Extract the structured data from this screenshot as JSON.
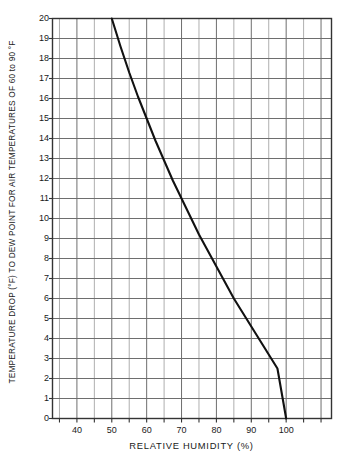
{
  "chart_data": {
    "type": "line",
    "title": "",
    "xlabel": "RELATIVE HUMIDITY (%)",
    "ylabel": "TEMPERATURE DROP (°F) TO DEW POINT FOR AIR TEMPERATURES OF 60 to 90 °F",
    "xlim": [
      33,
      113
    ],
    "ylim": [
      0,
      20
    ],
    "xticks": [
      40,
      50,
      60,
      70,
      80,
      90,
      100
    ],
    "yticks": [
      0,
      1,
      2,
      3,
      4,
      5,
      6,
      7,
      8,
      9,
      10,
      11,
      12,
      13,
      14,
      15,
      16,
      17,
      18,
      19,
      20
    ],
    "xtick_labels": [
      "40",
      "50",
      "60",
      "70",
      "80",
      "90",
      "100"
    ],
    "ytick_labels": [
      "0",
      "1",
      "2",
      "3",
      "4",
      "5",
      "6",
      "7",
      "8",
      "9",
      "10",
      "11",
      "12",
      "13",
      "14",
      "15",
      "16",
      "17",
      "18",
      "19",
      "20"
    ],
    "grid": true,
    "grid_x_step": 5,
    "grid_y_step": 1,
    "legend": null,
    "series": [
      {
        "name": "Temperature drop to dew point",
        "color": "#111111",
        "x": [
          50,
          52.5,
          55,
          57.5,
          60,
          62.5,
          65,
          67.5,
          70,
          72.5,
          75,
          77.5,
          80,
          82.5,
          85,
          87.5,
          90,
          92.5,
          95,
          97.5,
          100
        ],
        "y": [
          20,
          18.6,
          17.3,
          16.1,
          15.0,
          13.9,
          12.9,
          11.9,
          11.0,
          10.1,
          9.2,
          8.4,
          7.6,
          6.8,
          6.0,
          5.3,
          4.6,
          3.9,
          3.2,
          2.5,
          0
        ]
      }
    ]
  },
  "axes": {
    "y_title": "TEMPERATURE DROP (°F) TO DEW POINT FOR AIR TEMPERATURES OF 60 to 90 °F",
    "x_title": "RELATIVE HUMIDITY (%)"
  },
  "colors": {
    "curve": "#111111",
    "grid_major": "#6e6e6e",
    "grid_minor": "#9a9a9a",
    "frame": "#333333",
    "background": "#ffffff",
    "text": "#1a1a1a"
  }
}
